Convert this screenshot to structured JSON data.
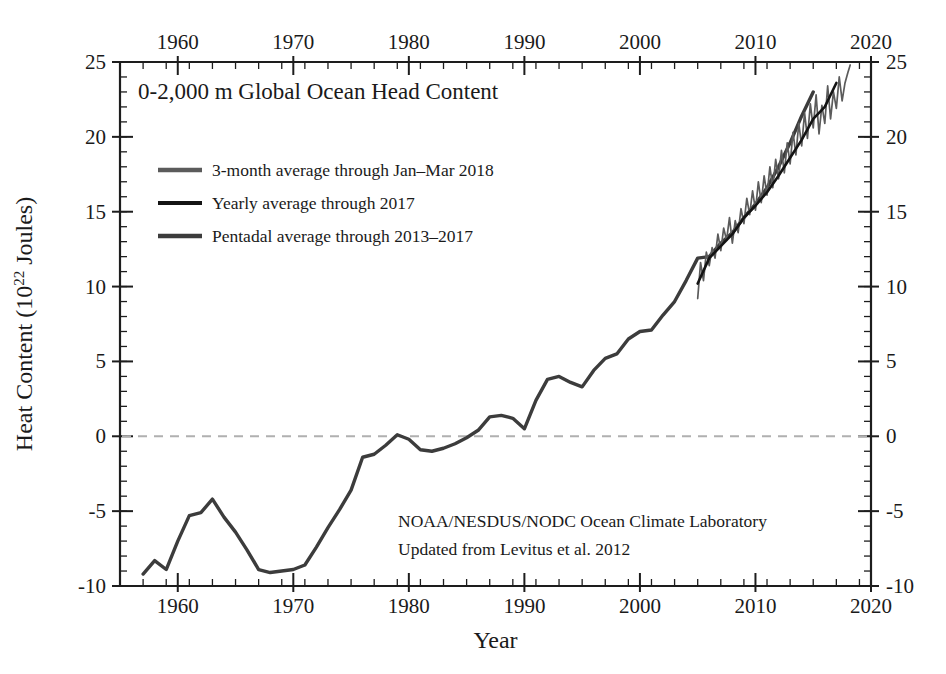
{
  "chart_data": {
    "type": "line",
    "title": "0-2,000 m Global Ocean Head Content",
    "xlabel": "Year",
    "ylabel": "Heat Content (10",
    "ylabel_sup": "22",
    "ylabel_tail": " Joules)",
    "xlim": [
      1955,
      2020
    ],
    "ylim": [
      -10,
      25
    ],
    "grid": false,
    "zero_line": true,
    "xticks": [
      1960,
      1970,
      1980,
      1990,
      2000,
      2010,
      2020
    ],
    "xtick_labels": [
      "1960",
      "1970",
      "1980",
      "1990",
      "2000",
      "2010",
      "2020"
    ],
    "yticks": [
      -10,
      -5,
      0,
      5,
      10,
      15,
      20,
      25
    ],
    "ytick_labels": [
      "-10",
      "-5",
      "0",
      "5",
      "10",
      "15",
      "20",
      "25"
    ],
    "x_minor_step": 2,
    "y_minor_step": 1,
    "legend_position": "upper-left-inside",
    "axes_mirrored": true,
    "series": [
      {
        "name": "3-month average through Jan–Mar 2018",
        "color": "#5b5b5b",
        "width": 1.7,
        "x": [
          2005.0,
          2005.25,
          2005.5,
          2005.75,
          2006.0,
          2006.25,
          2006.5,
          2006.75,
          2007.0,
          2007.25,
          2007.5,
          2007.75,
          2008.0,
          2008.25,
          2008.5,
          2008.75,
          2009.0,
          2009.25,
          2009.5,
          2009.75,
          2010.0,
          2010.25,
          2010.5,
          2010.75,
          2011.0,
          2011.25,
          2011.5,
          2011.75,
          2012.0,
          2012.25,
          2012.5,
          2012.75,
          2013.0,
          2013.25,
          2013.5,
          2013.75,
          2014.0,
          2014.25,
          2014.5,
          2014.75,
          2015.0,
          2015.25,
          2015.5,
          2015.75,
          2016.0,
          2016.25,
          2016.5,
          2016.75,
          2017.0,
          2017.25,
          2017.5,
          2017.75,
          2018.0,
          2018.2
        ],
        "values": [
          9.2,
          11.6,
          10.4,
          12.3,
          11.4,
          12.6,
          11.9,
          13.5,
          12.4,
          13.9,
          13.1,
          14.6,
          12.9,
          14.4,
          13.6,
          15.2,
          14.2,
          15.9,
          14.8,
          16.4,
          15.1,
          17.0,
          15.6,
          17.4,
          16.1,
          18.0,
          16.6,
          18.5,
          17.2,
          19.1,
          17.6,
          19.6,
          18.2,
          20.3,
          18.8,
          20.9,
          19.4,
          21.6,
          19.9,
          22.2,
          20.6,
          22.8,
          20.2,
          22.1,
          20.9,
          23.4,
          21.2,
          23.0,
          21.9,
          24.0,
          22.4,
          23.6,
          24.3,
          24.8
        ]
      },
      {
        "name": "Yearly average through 2017",
        "color": "#141414",
        "width": 2.6,
        "x": [
          2005,
          2006,
          2007,
          2008,
          2009,
          2010,
          2011,
          2012,
          2013,
          2014,
          2015,
          2016,
          2017
        ],
        "values": [
          10.2,
          11.9,
          12.7,
          13.5,
          14.6,
          15.4,
          16.3,
          17.4,
          18.6,
          19.8,
          21.2,
          22.0,
          23.6
        ]
      },
      {
        "name": "Pentadal average through 2013–2017",
        "color": "#3c3c3c",
        "width": 3.4,
        "x": [
          1957,
          1958,
          1959,
          1960,
          1961,
          1962,
          1963,
          1964,
          1965,
          1966,
          1967,
          1968,
          1969,
          1970,
          1971,
          1972,
          1973,
          1974,
          1975,
          1976,
          1977,
          1978,
          1979,
          1980,
          1981,
          1982,
          1983,
          1984,
          1985,
          1986,
          1987,
          1988,
          1989,
          1990,
          1991,
          1992,
          1993,
          1994,
          1995,
          1996,
          1997,
          1998,
          1999,
          2000,
          2001,
          2002,
          2003,
          2004,
          2005,
          2006,
          2007,
          2008,
          2009,
          2010,
          2011,
          2012,
          2013,
          2014,
          2015
        ],
        "values": [
          -9.2,
          -8.3,
          -8.9,
          -7.0,
          -5.3,
          -5.1,
          -4.2,
          -5.4,
          -6.4,
          -7.6,
          -8.9,
          -9.1,
          -9.0,
          -8.9,
          -8.6,
          -7.4,
          -6.1,
          -4.9,
          -3.6,
          -1.4,
          -1.2,
          -0.6,
          0.1,
          -0.2,
          -0.9,
          -1.0,
          -0.8,
          -0.5,
          -0.1,
          0.4,
          1.3,
          1.4,
          1.2,
          0.5,
          2.4,
          3.8,
          4.0,
          3.6,
          3.3,
          4.4,
          5.2,
          5.5,
          6.5,
          7.0,
          7.1,
          8.1,
          9.0,
          10.4,
          11.9,
          12.0,
          12.9,
          13.6,
          14.6,
          15.5,
          16.6,
          18.0,
          19.6,
          21.4,
          23.0
        ]
      }
    ],
    "annotations": [
      "NOAA/NESDUS/NODC Ocean Climate Laboratory",
      "Updated from Levitus et al. 2012"
    ]
  }
}
